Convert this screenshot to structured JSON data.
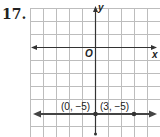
{
  "problem_number": "17.",
  "axes": {
    "x_label": "x",
    "y_label": "y",
    "origin_label": "O"
  },
  "points": [
    {
      "label": "(0, −5)",
      "x": 0,
      "y": -5
    },
    {
      "label": "(3, −5)",
      "x": 3,
      "y": -5
    }
  ],
  "line": {
    "equation": "y = -5",
    "color": "#444444"
  },
  "grid": {
    "x_range": [
      -5,
      5
    ],
    "y_range": [
      -3,
      6
    ],
    "color": "#bbbbbb"
  }
}
